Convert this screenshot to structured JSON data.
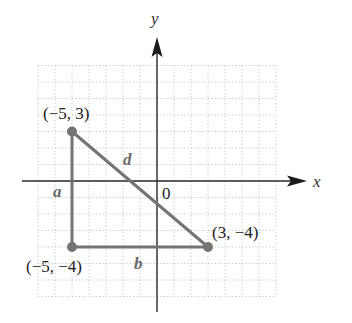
{
  "diagram": {
    "type": "coordinate-plane-right-triangle",
    "axes": {
      "x_label": "x",
      "y_label": "y",
      "origin_label": "0",
      "grid_range": {
        "x": [
          -7,
          7
        ],
        "y": [
          -7,
          7
        ]
      }
    },
    "points": [
      {
        "id": "A",
        "label": "(−5, 3)",
        "x": -5,
        "y": 3
      },
      {
        "id": "B",
        "label": "(−5, −4)",
        "x": -5,
        "y": -4
      },
      {
        "id": "C",
        "label": "(3, −4)",
        "x": 3,
        "y": -4
      }
    ],
    "segments": [
      {
        "id": "a",
        "label": "a",
        "from": "A",
        "to": "B"
      },
      {
        "id": "b",
        "label": "b",
        "from": "B",
        "to": "C"
      },
      {
        "id": "d",
        "label": "d",
        "from": "A",
        "to": "C"
      }
    ],
    "colors": {
      "triangle": "#747474",
      "axis": "#2a2a2a",
      "grid": "#c4c4c4",
      "text": "#222222",
      "segment_label": "#6a6a6a"
    }
  }
}
